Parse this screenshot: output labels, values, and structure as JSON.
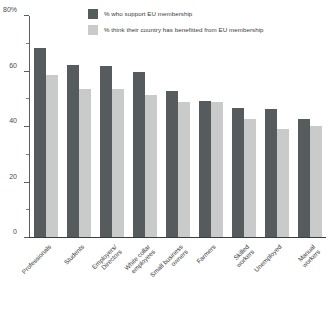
{
  "chart_data": {
    "type": "bar",
    "title": "",
    "subtitle": "",
    "xlabel": "",
    "ylabel": "",
    "ylim": [
      0,
      80
    ],
    "grid": false,
    "legend_position": "top-center",
    "y_ticks_major": [
      "0",
      "20",
      "40",
      "60",
      "80%"
    ],
    "y_tick_values": [
      0,
      20,
      40,
      60,
      80
    ],
    "y_ticks_minor": [
      10,
      30,
      50,
      70
    ],
    "categories": [
      "Professionals",
      "Students",
      "Employers/ Directors",
      "White collar employees",
      "Small business owners",
      "Farmers",
      "Skilled workers",
      "Unemployed",
      "Manual workers"
    ],
    "category_lines": [
      [
        "Professionals"
      ],
      [
        "Students"
      ],
      [
        "Employers/",
        "Directors"
      ],
      [
        "White collar",
        "employees"
      ],
      [
        "Small business",
        "owners"
      ],
      [
        "Farmers"
      ],
      [
        "Skilled",
        "workers"
      ],
      [
        "Unemployed"
      ],
      [
        "Manual",
        "workers"
      ]
    ],
    "series": [
      {
        "name": "% who support EU membership",
        "color": "#565b5d",
        "values": [
          68,
          62,
          61.5,
          59.5,
          52.5,
          49,
          46.5,
          46,
          42.5
        ]
      },
      {
        "name": "% think their country has benefitted from EU membership",
        "color": "#c9caca",
        "values": [
          58.5,
          53.5,
          53.5,
          51,
          48.5,
          48.5,
          42.5,
          39,
          40
        ]
      }
    ]
  },
  "legend": {
    "items": [
      {
        "label": "% who support EU membership",
        "color": "#565b5d"
      },
      {
        "label": "% think their country has benefitted from EU membership",
        "color": "#c9caca"
      }
    ]
  }
}
